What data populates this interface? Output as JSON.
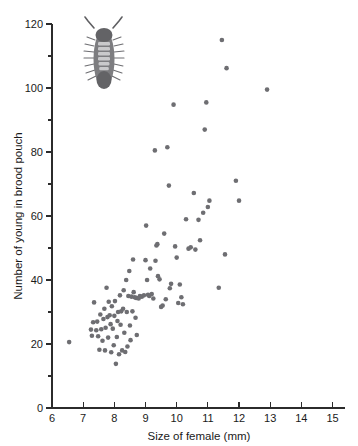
{
  "figure": {
    "illustration_name": "woodlouse-isopod-illustration"
  },
  "chart_data": {
    "type": "scatter",
    "title": "",
    "xlabel": "Size of female (mm)",
    "ylabel": "Number of young in brood pouch",
    "xlim": [
      6,
      15.4
    ],
    "ylim": [
      0,
      120
    ],
    "x_ticks": [
      6,
      7,
      8,
      9,
      10,
      11,
      12,
      13,
      14,
      15
    ],
    "x_tick_labels": [
      "6",
      "7",
      "8",
      "9",
      "10",
      "11",
      "12",
      "13",
      "14",
      "15"
    ],
    "y_ticks": [
      0,
      20,
      40,
      60,
      80,
      100,
      120
    ],
    "y_tick_labels": [
      "0",
      "20",
      "40",
      "60",
      "80",
      "100",
      "120"
    ],
    "y_minor_ticks": [
      10,
      30,
      50,
      70,
      90,
      110
    ],
    "grid": false,
    "legend": null,
    "marker": {
      "shape": "circle",
      "color": "#6e6e72",
      "size_px": 4.6
    },
    "series": [
      {
        "name": "Brood size vs female size",
        "points": [
          [
            6.55,
            20.6
          ],
          [
            7.25,
            24.5
          ],
          [
            7.28,
            22.6
          ],
          [
            7.32,
            26.8
          ],
          [
            7.35,
            33.0
          ],
          [
            7.42,
            24.3
          ],
          [
            7.45,
            27.0
          ],
          [
            7.48,
            22.4
          ],
          [
            7.52,
            18.2
          ],
          [
            7.55,
            29.2
          ],
          [
            7.58,
            24.6
          ],
          [
            7.62,
            21.0
          ],
          [
            7.65,
            27.8
          ],
          [
            7.68,
            31.0
          ],
          [
            7.7,
            18.0
          ],
          [
            7.72,
            25.1
          ],
          [
            7.75,
            37.6
          ],
          [
            7.78,
            28.4
          ],
          [
            7.8,
            22.0
          ],
          [
            7.82,
            33.2
          ],
          [
            7.85,
            29.0
          ],
          [
            7.88,
            26.2
          ],
          [
            7.9,
            17.4
          ],
          [
            7.92,
            31.8
          ],
          [
            7.95,
            24.8
          ],
          [
            7.98,
            19.6
          ],
          [
            8.0,
            28.8
          ],
          [
            8.02,
            33.4
          ],
          [
            8.05,
            13.8
          ],
          [
            8.08,
            22.2
          ],
          [
            8.1,
            27.2
          ],
          [
            8.12,
            30.0
          ],
          [
            8.15,
            16.8
          ],
          [
            8.18,
            35.2
          ],
          [
            8.2,
            26.0
          ],
          [
            8.22,
            30.2
          ],
          [
            8.25,
            18.0
          ],
          [
            8.28,
            31.0
          ],
          [
            8.3,
            36.8
          ],
          [
            8.32,
            23.5
          ],
          [
            8.35,
            17.5
          ],
          [
            8.38,
            40.0
          ],
          [
            8.4,
            30.0
          ],
          [
            8.42,
            19.2
          ],
          [
            8.45,
            35.0
          ],
          [
            8.48,
            42.8
          ],
          [
            8.5,
            25.8
          ],
          [
            8.52,
            21.2
          ],
          [
            8.55,
            34.8
          ],
          [
            8.58,
            30.2
          ],
          [
            8.6,
            46.4
          ],
          [
            8.62,
            36.2
          ],
          [
            8.65,
            34.6
          ],
          [
            8.68,
            28.2
          ],
          [
            8.7,
            34.4
          ],
          [
            8.72,
            22.8
          ],
          [
            8.78,
            34.2
          ],
          [
            8.82,
            35.0
          ],
          [
            8.88,
            34.8
          ],
          [
            8.95,
            35.2
          ],
          [
            9.0,
            46.2
          ],
          [
            9.02,
            57.0
          ],
          [
            9.05,
            40.0
          ],
          [
            9.08,
            35.4
          ],
          [
            9.12,
            35.0
          ],
          [
            9.15,
            43.6
          ],
          [
            9.2,
            35.6
          ],
          [
            9.25,
            34.2
          ],
          [
            9.3,
            80.5
          ],
          [
            9.32,
            46.0
          ],
          [
            9.35,
            50.8
          ],
          [
            9.38,
            51.2
          ],
          [
            9.4,
            41.2
          ],
          [
            9.45,
            40.2
          ],
          [
            9.5,
            31.6
          ],
          [
            9.55,
            32.0
          ],
          [
            9.6,
            54.5
          ],
          [
            9.65,
            34.0
          ],
          [
            9.7,
            81.5
          ],
          [
            9.75,
            69.5
          ],
          [
            9.78,
            37.4
          ],
          [
            9.82,
            38.8
          ],
          [
            9.9,
            94.8
          ],
          [
            9.95,
            50.5
          ],
          [
            10.0,
            47.0
          ],
          [
            10.05,
            32.8
          ],
          [
            10.1,
            38.6
          ],
          [
            10.15,
            34.6
          ],
          [
            10.2,
            32.4
          ],
          [
            10.3,
            59.0
          ],
          [
            10.38,
            49.8
          ],
          [
            10.45,
            50.2
          ],
          [
            10.55,
            67.2
          ],
          [
            10.6,
            49.5
          ],
          [
            10.7,
            58.8
          ],
          [
            10.75,
            52.4
          ],
          [
            10.85,
            61.0
          ],
          [
            10.9,
            87.0
          ],
          [
            10.95,
            95.5
          ],
          [
            11.0,
            62.8
          ],
          [
            11.05,
            64.8
          ],
          [
            11.35,
            37.6
          ],
          [
            11.45,
            115.0
          ],
          [
            11.55,
            48.0
          ],
          [
            11.6,
            106.2
          ],
          [
            11.9,
            71.0
          ],
          [
            12.0,
            64.8
          ],
          [
            12.9,
            99.5
          ]
        ]
      }
    ]
  }
}
